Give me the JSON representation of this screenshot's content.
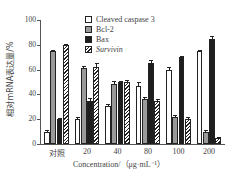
{
  "chart_data": {
    "type": "bar",
    "title": "",
    "xlabel": "Concentration/（μg·mL⁻¹）",
    "ylabel": "相对mRNA表达量/%",
    "ylim": [
      0,
      100
    ],
    "yticks": [
      0,
      20,
      40,
      60,
      80,
      100
    ],
    "grid": false,
    "legend_position": "top-right",
    "categories": [
      "对照",
      "20",
      "40",
      "80",
      "100",
      "200"
    ],
    "series": [
      {
        "name": "Cleaved caspase 3",
        "values": [
          10,
          20,
          31,
          47,
          60,
          75
        ],
        "errors": [
          1,
          2,
          1,
          3,
          2,
          1
        ],
        "fill": "white"
      },
      {
        "name": "Bcl-2",
        "values": [
          75,
          61,
          48,
          36,
          22,
          10
        ],
        "errors": [
          1,
          2,
          3,
          2,
          1,
          1
        ],
        "fill": "#9a9a9a"
      },
      {
        "name": "Bax",
        "values": [
          20,
          35,
          50,
          65,
          70,
          85
        ],
        "errors": [
          1,
          2,
          1,
          3,
          1,
          2
        ],
        "fill": "#1e1e1e"
      },
      {
        "name": "Survivin",
        "values": [
          80,
          62,
          50,
          35,
          20,
          5
        ],
        "errors": [
          1,
          3,
          2,
          1,
          2,
          1
        ],
        "fill": "hatched"
      }
    ]
  },
  "legend": [
    "Cleaved caspase 3",
    "Bcl-2",
    "Bax",
    "Survivin"
  ]
}
